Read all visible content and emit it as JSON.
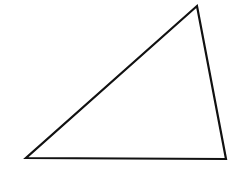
{
  "diagram": {
    "shape": "triangle",
    "stroke_color": "#111111",
    "fill_color": "#ffffff",
    "stroke_width": 2.2,
    "vertices": {
      "top": [
        197,
        6
      ],
      "bottom_left": [
        26,
        158
      ],
      "bottom_right": [
        226,
        159
      ]
    },
    "points": "197,6 26,158 226,159"
  }
}
